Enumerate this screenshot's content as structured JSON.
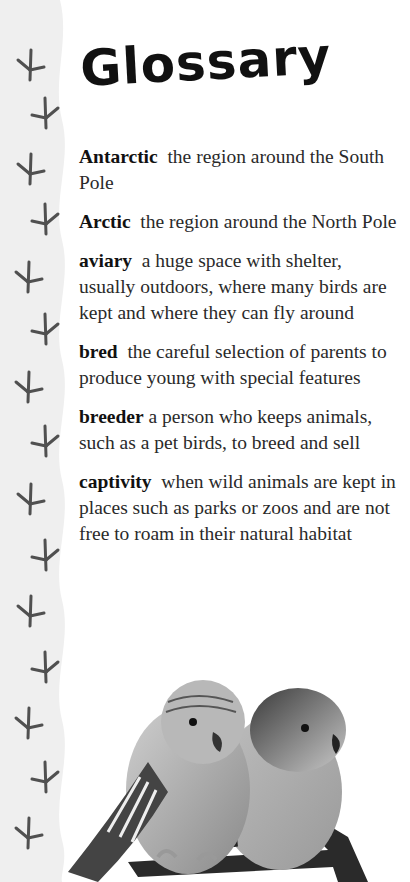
{
  "page": {
    "title": "Glossary"
  },
  "glossary": {
    "entries": [
      {
        "term": "Antarctic",
        "definition": "the region around the South Pole"
      },
      {
        "term": "Arctic",
        "definition": "the region around the North Pole"
      },
      {
        "term": "aviary",
        "definition": "a huge space with shelter, usually outdoors, where many birds are kept and where they can fly around"
      },
      {
        "term": "bred",
        "definition": "the careful selection of parents to produce young with special features"
      },
      {
        "term": "breeder",
        "definition": "a person who keeps animals, such as a pet birds, to breed and sell"
      },
      {
        "term": "captivity",
        "definition": "when wild animals are kept in places such as parks or zoos and are not free to roam in their natural habitat"
      }
    ]
  },
  "decor": {
    "sidebar_icon": "bird-footprint-icon",
    "footprint_count": 14,
    "photo": "two-budgerigars-on-perch",
    "colors": {
      "strip": "#efefef",
      "footprint": "#505050",
      "text": "#2a2a2a",
      "term": "#111111"
    }
  }
}
